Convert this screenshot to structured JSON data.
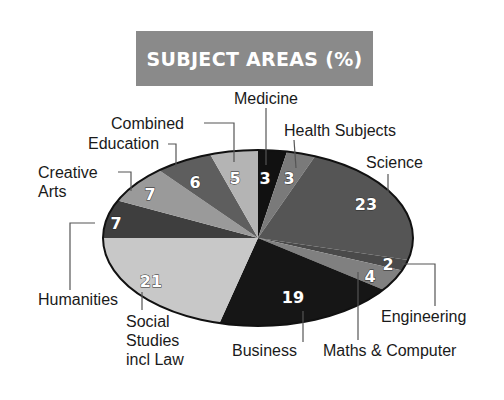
{
  "chart_data": {
    "type": "pie",
    "title": "SUBJECT AREAS (%)",
    "unit": "%",
    "start": "top (12 o'clock), clockwise",
    "slices": [
      {
        "label": "Medicine",
        "value": 3,
        "color": "#111111"
      },
      {
        "label": "Health Subjects",
        "value": 3,
        "color": "#7a7a7a"
      },
      {
        "label": "Science",
        "value": 23,
        "color": "#555555"
      },
      {
        "label": "Engineering",
        "value": 2,
        "color": "#4a4a4a"
      },
      {
        "label": "Maths & Computer",
        "value": 4,
        "color": "#808080"
      },
      {
        "label": "Business",
        "value": 19,
        "color": "#161616"
      },
      {
        "label": "Social Studies incl Law",
        "value": 21,
        "color": "#c8c8c8"
      },
      {
        "label": "Humanities",
        "value": 7,
        "color": "#3e3e3e"
      },
      {
        "label": "Creative Arts",
        "value": 7,
        "color": "#9a9a9a"
      },
      {
        "label": "Education",
        "value": 6,
        "color": "#5e5e5e"
      },
      {
        "label": "Combined",
        "value": 5,
        "color": "#b4b4b4"
      }
    ],
    "legend": "leader-line callouts"
  },
  "title": "SUBJECT AREAS (%)",
  "labels": {
    "medicine": "Medicine",
    "health": "Health Subjects",
    "science": "Science",
    "engineering": "Engineering",
    "maths": "Maths & Computer",
    "business": "Business",
    "social_1": "Social",
    "social_2": "Studies",
    "social_3": "incl Law",
    "humanities": "Humanities",
    "creative_1": "Creative",
    "creative_2": "Arts",
    "education": "Education",
    "combined": "Combined"
  },
  "values": {
    "medicine": "3",
    "health": "3",
    "science": "23",
    "engineering": "2",
    "maths": "4",
    "business": "19",
    "social": "21",
    "humanities": "7",
    "creative": "7",
    "education": "6",
    "combined": "5"
  }
}
